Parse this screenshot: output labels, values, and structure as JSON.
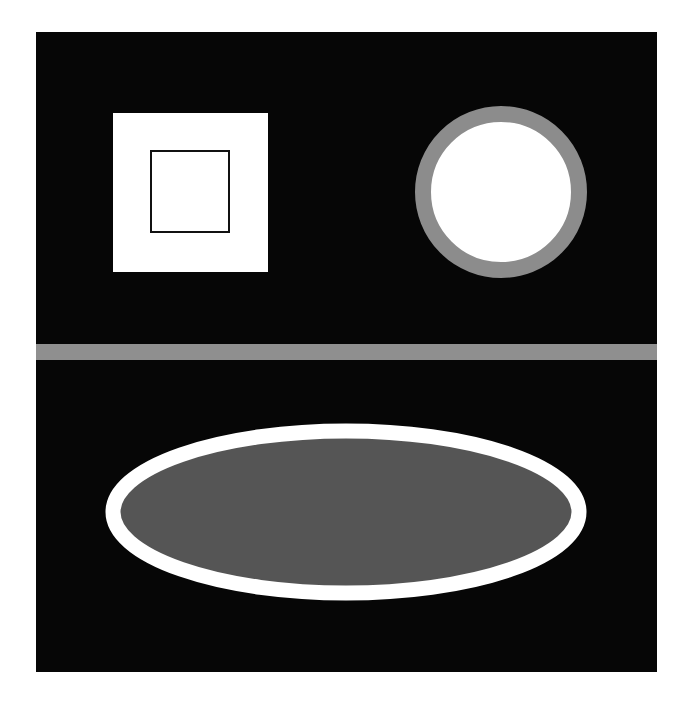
{
  "canvas": {
    "width": 689,
    "height": 708,
    "background": "#ffffff"
  },
  "panel": {
    "x": 36,
    "y": 32,
    "width": 621,
    "height": 640,
    "fill": "#060606"
  },
  "shapes": {
    "outer_square": {
      "x": 113,
      "y": 113,
      "width": 155,
      "height": 159,
      "fill": "#ffffff"
    },
    "inner_square": {
      "x": 151,
      "y": 151,
      "width": 78,
      "height": 81,
      "fill": "#ffffff",
      "stroke": "#111111",
      "stroke_width": 2
    },
    "ring_circle": {
      "cx": 501,
      "cy": 192,
      "r": 78,
      "fill": "#ffffff",
      "stroke": "#8c8c8c",
      "stroke_width": 16
    },
    "divider_bar": {
      "x": 36,
      "y": 344,
      "width": 621,
      "height": 16,
      "fill": "#8f8f8f"
    },
    "ellipse": {
      "cx": 346,
      "cy": 512,
      "rx": 233,
      "ry": 81,
      "fill": "#555555",
      "stroke": "#ffffff",
      "stroke_width": 15
    }
  }
}
